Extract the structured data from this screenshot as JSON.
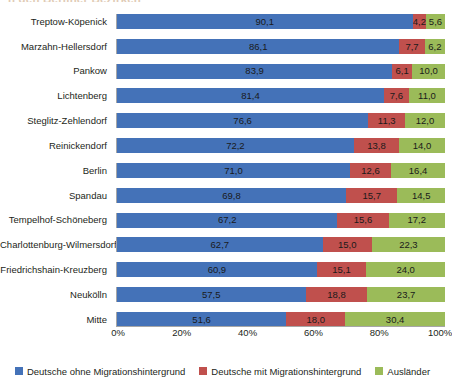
{
  "title_sliver": "n den Berliner Bezirken",
  "chart_data": {
    "type": "bar",
    "orientation": "horizontal",
    "stacked": true,
    "stack_mode": "percent",
    "title": "",
    "xlabel": "",
    "ylabel": "",
    "xlim": [
      0,
      100
    ],
    "grid": false,
    "legend_position": "bottom",
    "xticks": [
      "0%",
      "20%",
      "40%",
      "60%",
      "80%",
      "100%"
    ],
    "xtick_values": [
      0,
      20,
      40,
      60,
      80,
      100
    ],
    "categories": [
      "Treptow-Köpenick",
      "Marzahn-Hellersdorf",
      "Pankow",
      "Lichtenberg",
      "Steglitz-Zehlendorf",
      "Reinickendorf",
      "Berlin",
      "Spandau",
      "Tempelhof-Schöneberg",
      "Charlottenburg-Wilmersdorf",
      "Friedrichshain-Kreuzberg",
      "Neukölln",
      "Mitte"
    ],
    "series": [
      {
        "name": "Deutsche ohne Migrationshintergrund",
        "color": "#4472b8",
        "values": [
          90.1,
          86.1,
          83.9,
          81.4,
          76.6,
          72.2,
          71.0,
          69.8,
          67.2,
          62.7,
          60.9,
          57.5,
          51.6
        ],
        "labels": [
          "90,1",
          "86,1",
          "83,9",
          "81,4",
          "76,6",
          "72,2",
          "71,0",
          "69,8",
          "67,2",
          "62,7",
          "60,9",
          "57,5",
          "51,6"
        ]
      },
      {
        "name": "Deutsche mit Migrationshintergrund",
        "color": "#c0504d",
        "values": [
          4.2,
          7.7,
          6.1,
          7.6,
          11.3,
          13.8,
          12.6,
          15.7,
          15.6,
          15.0,
          15.1,
          18.8,
          18.0
        ],
        "labels": [
          "4,2",
          "7,7",
          "6,1",
          "7,6",
          "11,3",
          "13,8",
          "12,6",
          "15,7",
          "15,6",
          "15,0",
          "15,1",
          "18,8",
          "18,0"
        ]
      },
      {
        "name": "Ausländer",
        "color": "#9bbb59",
        "values": [
          5.6,
          6.2,
          10.0,
          11.0,
          12.0,
          14.0,
          16.4,
          14.5,
          17.2,
          22.3,
          24.0,
          23.7,
          30.4
        ],
        "labels": [
          "5,6",
          "6,2",
          "10,0",
          "11,0",
          "12,0",
          "14,0",
          "16,4",
          "14,5",
          "17,2",
          "22,3",
          "24,0",
          "23,7",
          "30,4"
        ]
      }
    ]
  }
}
